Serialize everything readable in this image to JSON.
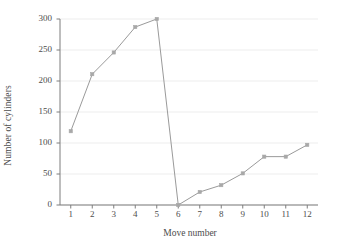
{
  "chart_data": {
    "type": "line",
    "title": "",
    "subtitle": "",
    "xlabel": "Move number",
    "ylabel": "Number of cylinders",
    "x": [
      1,
      2,
      3,
      4,
      5,
      6,
      7,
      8,
      9,
      10,
      11,
      12
    ],
    "xticklabels": [
      "1",
      "2",
      "3",
      "4",
      "5",
      "6",
      "7",
      "8",
      "9",
      "10",
      "11",
      "12"
    ],
    "values": [
      119,
      211,
      246,
      287,
      300,
      0,
      21,
      32,
      51,
      78,
      78,
      97
    ],
    "series": [
      {
        "name": "Number of cylinders",
        "values": [
          119,
          211,
          246,
          287,
          300,
          0,
          21,
          32,
          51,
          78,
          78,
          97
        ]
      }
    ],
    "yticks": [
      0,
      50,
      100,
      150,
      200,
      250,
      300
    ],
    "yticklabels": [
      "0",
      "50",
      "100",
      "150",
      "200",
      "250",
      "300"
    ],
    "ylim": [
      0,
      300
    ],
    "xlim": [
      0.5,
      12.5
    ],
    "grid": "horizontal-only",
    "legend": "none",
    "marker": "square",
    "line_color": "#9a9a9a",
    "marker_color": "#a8a8a8",
    "axis_color": "#7d7d7d",
    "grid_color": "#ededed",
    "text_color": "#4d4d4d",
    "background": "#ffffff"
  }
}
